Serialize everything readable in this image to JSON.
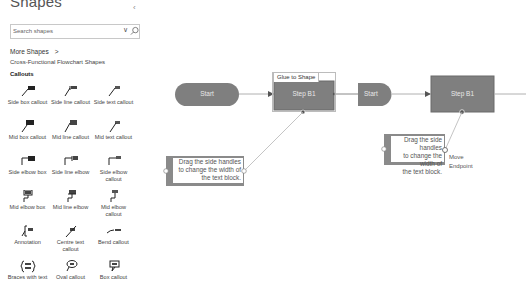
{
  "sidebar": {
    "title": "Shapes",
    "collapse_icon": "chevron-left-icon",
    "search": {
      "placeholder": "Search shapes",
      "value": ""
    },
    "more_shapes_label": "More Shapes",
    "more_shapes_chevron": ">",
    "stencil_name": "Cross-Functional Flowchart Shapes",
    "section_title": "Callouts",
    "shapes": [
      {
        "label": "Side box callout",
        "icon": "side-box-callout-icon"
      },
      {
        "label": "Side line callout",
        "icon": "side-line-callout-icon"
      },
      {
        "label": "Side text callout",
        "icon": "side-text-callout-icon"
      },
      {
        "label": "Mid box callout",
        "icon": "mid-box-callout-icon"
      },
      {
        "label": "Mid line callout",
        "icon": "mid-line-callout-icon"
      },
      {
        "label": "Mid text callout",
        "icon": "mid-text-callout-icon"
      },
      {
        "label": "Side elbow box",
        "icon": "side-elbow-box-icon"
      },
      {
        "label": "Side line elbow",
        "icon": "side-line-elbow-icon"
      },
      {
        "label": "Side elbow callout",
        "icon": "side-elbow-callout-icon"
      },
      {
        "label": "Mid elbow box",
        "icon": "mid-elbow-box-icon"
      },
      {
        "label": "Mid line elbow",
        "icon": "mid-line-elbow-icon"
      },
      {
        "label": "Mid elbow callout",
        "icon": "mid-elbow-callout-icon"
      },
      {
        "label": "Annotation",
        "icon": "annotation-icon"
      },
      {
        "label": "Centre text callout",
        "icon": "centre-text-callout-icon"
      },
      {
        "label": "Bend callout",
        "icon": "bend-callout-icon"
      },
      {
        "label": "Braces with text",
        "icon": "braces-with-text-icon"
      },
      {
        "label": "Oval callout",
        "icon": "oval-callout-icon"
      },
      {
        "label": "Box callout",
        "icon": "box-callout-icon"
      }
    ]
  },
  "canvas": {
    "colors": {
      "shape_fill": "#7f7f7f",
      "shape_border": "#6b6b6b",
      "shape_text": "#e8e8e8",
      "connector": "#b0b0b0",
      "callout_border": "#8a8a8a"
    },
    "left_diagram": {
      "start_label": "Start",
      "step_label": "Step B1",
      "tooltip": "Glue to Shape",
      "callout_text": [
        "Drag the side handles",
        "to change the width of",
        "the text block."
      ]
    },
    "right_diagram": {
      "start_label": "Start",
      "step_label": "Step B1",
      "callout_text": [
        "Drag the side handles",
        "to change the width of",
        "the text block."
      ],
      "tooltip": [
        "Move",
        "Endpoint"
      ]
    }
  }
}
